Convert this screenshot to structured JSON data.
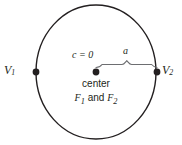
{
  "figure": {
    "type": "geometry-diagram",
    "background_color": "#ffffff",
    "stroke_color": "#231f20",
    "brace_color": "#58595b",
    "circle": {
      "center_x": 96,
      "center_y": 72,
      "radius_x": 60,
      "radius_y": 67
    },
    "points": [
      {
        "id": "v1",
        "label": "V",
        "subscript": "1",
        "x": 36,
        "y": 72
      },
      {
        "id": "center",
        "label": "",
        "subscript": "",
        "x": 96,
        "y": 72
      },
      {
        "id": "v2",
        "label": "V",
        "subscript": "2",
        "x": 157,
        "y": 72
      }
    ],
    "labels": {
      "v1": "V",
      "v1_sub": "1",
      "v2": "V",
      "v2_sub": "2",
      "eccentricity": "c = 0",
      "semi_axis": "a",
      "center_word": "center",
      "foci_f": "F",
      "foci_sub1": "1",
      "foci_and": " and ",
      "foci_f2": "F",
      "foci_sub2": "2"
    },
    "brace": {
      "from_x": 96,
      "to_x": 157,
      "y": 67,
      "peak_x": 127,
      "measures": "a"
    }
  }
}
